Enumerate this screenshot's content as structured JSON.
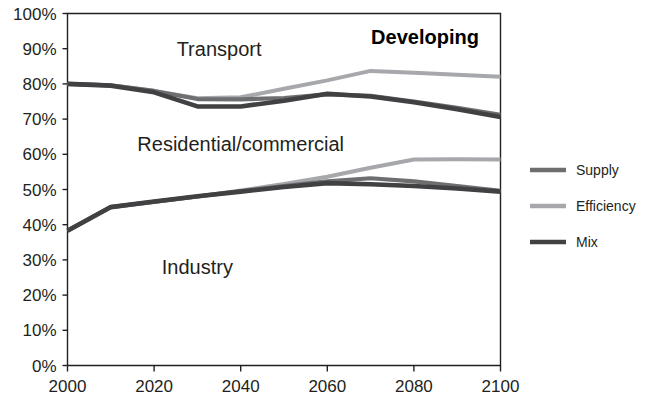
{
  "chart_data": {
    "type": "line",
    "title": "Developing",
    "xlabel": "",
    "ylabel": "",
    "xlim": [
      2000,
      2100
    ],
    "ylim": [
      0,
      100
    ],
    "grid": false,
    "legend_position": "right",
    "x_ticks": [
      "2000",
      "2020",
      "2040",
      "2060",
      "2080",
      "2100"
    ],
    "y_ticks": [
      "0%",
      "10%",
      "20%",
      "30%",
      "40%",
      "50%",
      "60%",
      "70%",
      "80%",
      "90%",
      "100%"
    ],
    "x": [
      2000,
      2010,
      2020,
      2030,
      2040,
      2050,
      2060,
      2070,
      2080,
      2090,
      2100
    ],
    "annotations": [
      {
        "text": "Transport",
        "x": 2035,
        "y": 90
      },
      {
        "text": "Residential/commercial",
        "x": 2040,
        "y": 63
      },
      {
        "text": "Industry",
        "x": 2030,
        "y": 28
      }
    ],
    "series": [
      {
        "name": "Supply",
        "color": "#6d6e70",
        "boundaries": [
          {
            "name": "upper",
            "values": [
              80.0,
              79.6,
              78.0,
              75.7,
              75.6,
              76.0,
              77.0,
              76.6,
              75.0,
              73.2,
              71.2
            ]
          },
          {
            "name": "lower",
            "values": [
              38.3,
              45.0,
              46.5,
              48.0,
              49.5,
              51.0,
              52.3,
              53.2,
              52.3,
              51.0,
              49.6
            ]
          }
        ]
      },
      {
        "name": "Efficiency",
        "color": "#a6a8ab",
        "boundaries": [
          {
            "name": "upper",
            "values": [
              80.0,
              79.6,
              78.0,
              75.9,
              76.2,
              78.6,
              81.0,
              83.7,
              83.2,
              82.6,
              82.0
            ]
          },
          {
            "name": "lower",
            "values": [
              38.3,
              45.0,
              46.5,
              48.0,
              49.7,
              51.6,
              53.6,
              56.2,
              58.5,
              58.6,
              58.5
            ]
          }
        ]
      },
      {
        "name": "Mix",
        "color": "#414042",
        "boundaries": [
          {
            "name": "upper",
            "values": [
              80.0,
              79.5,
              77.6,
              73.6,
              73.6,
              75.2,
              77.2,
              76.4,
              74.8,
              72.8,
              70.6
            ]
          },
          {
            "name": "lower",
            "values": [
              38.3,
              45.0,
              46.6,
              48.1,
              49.4,
              50.7,
              51.8,
              51.5,
              51.0,
              50.3,
              49.4
            ]
          }
        ]
      }
    ]
  },
  "legend": {
    "items": [
      {
        "label": "Supply",
        "color": "#6d6e70"
      },
      {
        "label": "Efficiency",
        "color": "#a6a8ab"
      },
      {
        "label": "Mix",
        "color": "#414042"
      }
    ]
  }
}
